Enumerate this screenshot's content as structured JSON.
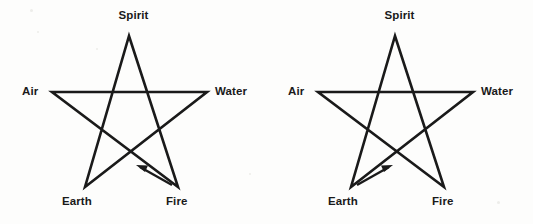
{
  "figure": {
    "background_color": "#fdfdfc",
    "stroke_color": "#1a1a1a",
    "label_color": "#1a1a1a"
  },
  "diagrams": [
    {
      "id": "banishing-pentagram",
      "position": "left",
      "labels": {
        "spirit": "Spirit",
        "air": "Air",
        "water": "Water",
        "earth": "Earth",
        "fire": "Fire"
      },
      "vertices": {
        "spirit": [
          129,
          36
        ],
        "air": [
          52,
          92
        ],
        "water": [
          207,
          92
        ],
        "earth": [
          85,
          187
        ],
        "fire": [
          178,
          187
        ]
      },
      "arrow": {
        "name": "direction-arrow",
        "from": "fire",
        "to": "earth",
        "tail": [
          170,
          184
        ],
        "head": [
          138,
          166
        ],
        "direction": "up-left"
      }
    },
    {
      "id": "invoking-pentagram",
      "position": "right",
      "labels": {
        "spirit": "Spirit",
        "air": "Air",
        "water": "Water",
        "earth": "Earth",
        "fire": "Fire"
      },
      "vertices": {
        "spirit": [
          129,
          36
        ],
        "air": [
          52,
          92
        ],
        "water": [
          207,
          92
        ],
        "earth": [
          85,
          187
        ],
        "fire": [
          178,
          187
        ]
      },
      "arrow": {
        "name": "direction-arrow",
        "from": "earth",
        "to": "spirit",
        "tail": [
          93,
          184
        ],
        "head": [
          125,
          166
        ],
        "direction": "up-right"
      }
    }
  ]
}
